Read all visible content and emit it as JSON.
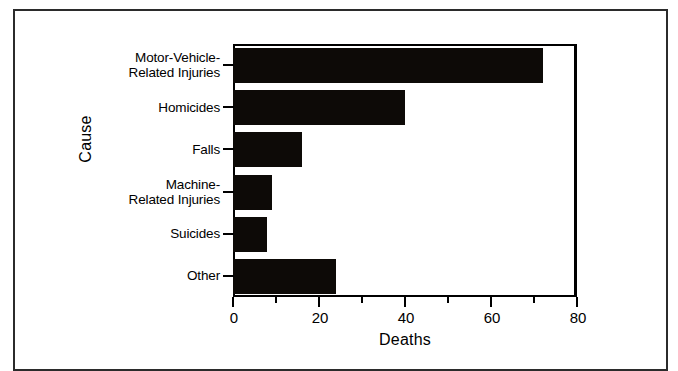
{
  "chart_data": {
    "type": "bar",
    "orientation": "horizontal",
    "title": "",
    "xlabel": "Deaths",
    "ylabel": "Cause",
    "categories": [
      "Motor-Vehicle-\nRelated Injuries",
      "Homicides",
      "Falls",
      "Machine-\nRelated Injuries",
      "Suicides",
      "Other"
    ],
    "values": [
      72,
      40,
      16,
      9,
      8,
      24
    ],
    "xlim": [
      0,
      80
    ],
    "xticks": [
      0,
      20,
      40,
      60,
      80
    ],
    "xtick_labels": [
      "0",
      "20",
      "40",
      "60",
      "80"
    ],
    "xminor_ticks": [
      10,
      30,
      50,
      70
    ],
    "grid": false,
    "legend": false,
    "bar_color": "#0d0a07",
    "axis_color": "#000000",
    "background": "#ffffff"
  },
  "figure": {
    "frame_color": "#2b2b2b",
    "page_background": "#ffffff"
  }
}
